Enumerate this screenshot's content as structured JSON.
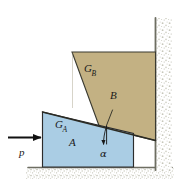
{
  "figure": {
    "type": "engineering-mechanics-free-body-diagram"
  },
  "colors": {
    "block_a_fill": "#aacde4",
    "block_a_stroke": "#2c2c2c",
    "block_b_fill": "#c3b183",
    "block_b_stroke": "#2c2c2c",
    "wall_line": "#6e6e62",
    "ground_line": "#6e6e62",
    "hatch_speckle": "#c9c9bd",
    "arrow": "#111111",
    "text": "#1a1a1a",
    "background": "#ffffff"
  },
  "blocks": {
    "wedge": {
      "label": "A",
      "centroid_label": "G",
      "centroid_subscript": "A",
      "fill": "#aacde4"
    },
    "upper": {
      "label": "B",
      "centroid_label": "G",
      "centroid_subscript": "B",
      "fill": "#c3b183"
    }
  },
  "force": {
    "label": "p",
    "direction": "right",
    "arrow_name": "applied-force-arrow"
  },
  "angle": {
    "label": "α",
    "name": "wedge-angle"
  },
  "supports": {
    "wall": "vertical-fixed-wall",
    "ground": "horizontal-fixed-ground"
  },
  "geometry": {
    "wedge_points": "42,112 133,133 133,167 42,167",
    "block_b_points": "72,52 155,52 155,140 99,127",
    "incline_line": "42,112 155,140",
    "wall_x": 155,
    "wall_top": 18,
    "wall_bottom": 170,
    "ground_y": 167,
    "ground_x1": 28,
    "ground_x2": 172,
    "force_arrow_y": 137,
    "force_arrow_x1": 8,
    "force_arrow_x2": 42,
    "alpha_vertex_x": 107,
    "alpha_vertex_y": 126
  }
}
